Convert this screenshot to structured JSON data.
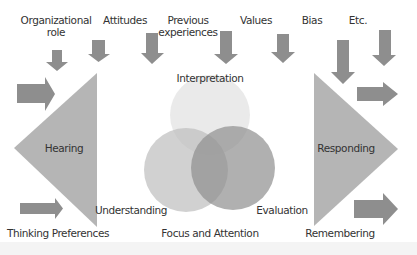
{
  "diagram": {
    "influences": [
      {
        "label": "Organizational",
        "label2": "role"
      },
      {
        "label": "Attitudes"
      },
      {
        "label": "Previous",
        "label2": "experiences"
      },
      {
        "label": "Values"
      },
      {
        "label": "Bias"
      },
      {
        "label": "Etc."
      }
    ],
    "left_stage": {
      "label": "Hearing"
    },
    "right_stage": {
      "label": "Responding"
    },
    "circles": [
      {
        "label": "Interpretation",
        "color": "#e6e6e6"
      },
      {
        "label": "Understanding",
        "color": "#c9c9c9"
      },
      {
        "label": "Evaluation",
        "color": "#a9a9a9"
      }
    ],
    "bottom_labels": {
      "thinking": "Thinking Preferences",
      "focus": "Focus and Attention",
      "remembering": "Remembering"
    },
    "colors": {
      "arrow": "#8e8e8e",
      "triangle": "#b5b5b5",
      "background": "#ffffff",
      "band": "#f4f4f4"
    }
  }
}
